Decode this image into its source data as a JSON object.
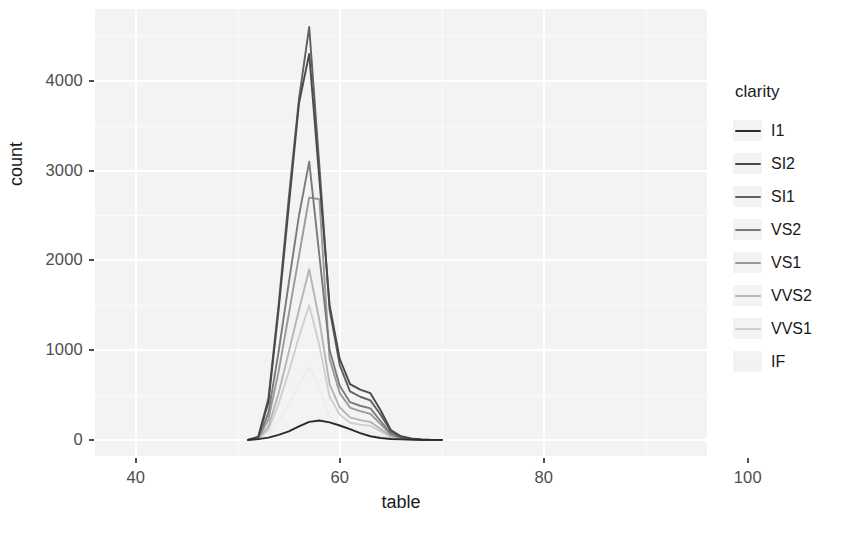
{
  "chart_data": {
    "type": "line",
    "title": "",
    "subtitle": "",
    "xlabel": "table",
    "ylabel": "count",
    "xlim": [
      36,
      96
    ],
    "ylim": [
      -180,
      4800
    ],
    "xticks": [
      40,
      60,
      80,
      100
    ],
    "yticks": [
      0,
      1000,
      2000,
      3000,
      4000
    ],
    "grid": true,
    "grid_color": "#ffffff",
    "panel_background": "#f3f3f3",
    "legend": {
      "title": "clarity",
      "position": "right",
      "entries": [
        "I1",
        "SI2",
        "SI1",
        "VS2",
        "VS1",
        "VVS2",
        "VVS1",
        "IF"
      ]
    },
    "x": [
      51,
      52,
      53,
      54,
      55,
      56,
      57,
      58,
      59,
      60,
      61,
      62,
      63,
      64,
      65,
      66,
      67,
      68,
      69,
      70
    ],
    "series": [
      {
        "name": "I1",
        "color": "#2b2b2b",
        "values": [
          0,
          8,
          25,
          55,
          95,
          150,
          200,
          215,
          195,
          160,
          120,
          75,
          40,
          20,
          10,
          5,
          2,
          0,
          0,
          0
        ]
      },
      {
        "name": "SI2",
        "color": "#4a4a4a",
        "values": [
          0,
          30,
          420,
          1450,
          2600,
          3750,
          4300,
          2900,
          1500,
          900,
          620,
          560,
          520,
          330,
          110,
          40,
          15,
          5,
          0,
          0
        ]
      },
      {
        "name": "SI1",
        "color": "#606060",
        "values": [
          0,
          35,
          460,
          1500,
          2700,
          3800,
          4600,
          3050,
          1450,
          830,
          540,
          480,
          440,
          280,
          95,
          30,
          10,
          3,
          0,
          0
        ]
      },
      {
        "name": "VS2",
        "color": "#7a7a7a",
        "values": [
          0,
          20,
          300,
          980,
          1750,
          2500,
          3100,
          2050,
          1000,
          600,
          420,
          380,
          350,
          210,
          70,
          25,
          8,
          0,
          0,
          0
        ]
      },
      {
        "name": "VS1",
        "color": "#9a9a9a",
        "values": [
          0,
          15,
          230,
          760,
          1400,
          2050,
          2700,
          2680,
          900,
          520,
          360,
          320,
          290,
          175,
          55,
          18,
          6,
          0,
          0,
          0
        ]
      },
      {
        "name": "VVS2",
        "color": "#b5b5b5",
        "values": [
          0,
          10,
          150,
          520,
          980,
          1450,
          1900,
          1330,
          620,
          360,
          250,
          220,
          200,
          120,
          40,
          12,
          4,
          0,
          0,
          0
        ]
      },
      {
        "name": "VVS1",
        "color": "#cfcfcf",
        "values": [
          0,
          8,
          110,
          400,
          760,
          1150,
          1500,
          1050,
          480,
          280,
          190,
          170,
          155,
          95,
          30,
          10,
          3,
          0,
          0,
          0
        ]
      },
      {
        "name": "IF",
        "color": "#ededed",
        "values": [
          0,
          4,
          60,
          210,
          400,
          620,
          820,
          570,
          260,
          150,
          105,
          92,
          85,
          52,
          17,
          6,
          2,
          0,
          0,
          0
        ]
      }
    ]
  },
  "legend_swatch_colors": [
    "#2b2b2b",
    "#4a4a4a",
    "#606060",
    "#7a7a7a",
    "#9a9a9a",
    "#b5b5b5",
    "#cfcfcf",
    "#f2f2f2"
  ]
}
